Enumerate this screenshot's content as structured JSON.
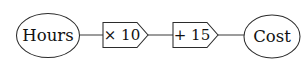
{
  "diagram": {
    "type": "function-machine-flowchart",
    "background_color": "#ffffff",
    "stroke_color": "#2b2b2b",
    "text_color": "#111111",
    "input_node": {
      "label": "Hours",
      "shape": "ellipse"
    },
    "operations": [
      {
        "label": "× 10",
        "shape": "pentagon-arrow",
        "operator": "×",
        "operand": "10"
      },
      {
        "label": "+ 15",
        "shape": "pentagon-arrow",
        "operator": "+",
        "operand": "15"
      }
    ],
    "output_node": {
      "label": "Cost",
      "shape": "ellipse"
    },
    "connectors": [
      {
        "from": "Hours",
        "to": "× 10"
      },
      {
        "from": "× 10",
        "to": "+ 15"
      },
      {
        "from": "+ 15",
        "to": "Cost"
      }
    ]
  }
}
